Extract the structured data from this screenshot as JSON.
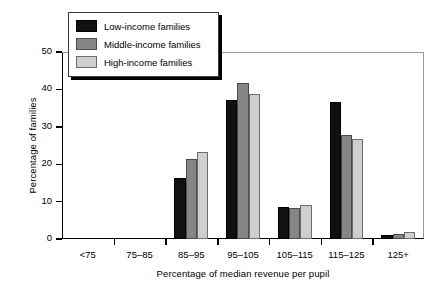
{
  "chart_data": {
    "type": "bar",
    "title": "",
    "xlabel": "Percentage of median revenue per pupil",
    "ylabel": "Percentage of families",
    "categories": [
      "<75",
      "75–85",
      "85–95",
      "95–105",
      "105–115",
      "115–125",
      "125+"
    ],
    "series": [
      {
        "name": "Low-income families",
        "color": "#111111",
        "values": [
          0,
          0,
          16.2,
          37.2,
          8.5,
          36.6,
          1.2
        ]
      },
      {
        "name": "Middle-income families",
        "color": "#868686",
        "values": [
          0,
          0,
          21.3,
          41.8,
          8.2,
          27.7,
          1.4
        ]
      },
      {
        "name": "High-income families",
        "color": "#cfcfcf",
        "values": [
          0,
          0,
          23.2,
          38.7,
          9.2,
          26.8,
          1.9
        ]
      }
    ],
    "ylim": [
      0,
      50
    ],
    "yticks": [
      0,
      10,
      20,
      30,
      40,
      50
    ],
    "ytick_labels": [
      "0",
      "10",
      "20",
      "30",
      "40",
      "50"
    ],
    "grid": false,
    "legend_position": "upper-left"
  }
}
